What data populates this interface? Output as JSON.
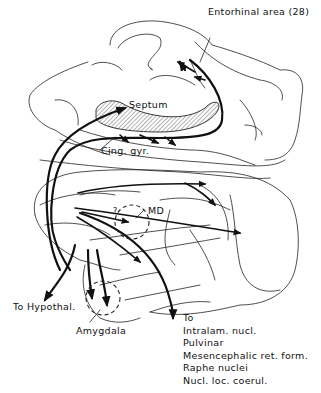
{
  "diagram": {
    "type": "anatomical pathway diagram (brain, lateral/medial view)",
    "labels": {
      "entorhinal": "Entorhinal area (28)",
      "septum": "Septum",
      "cingulate": "Cing. gyr.",
      "md": "MD",
      "question": "?",
      "hypothal": "To Hypothal.",
      "amygdala": "Amygdala",
      "to": "To"
    },
    "targets": [
      "Intralam. nucl.",
      "Pulvinar",
      "Mesencephalic ret. form.",
      "Raphe nuclei",
      "Nucl. loc. coerul."
    ],
    "colors": {
      "line": "#111111",
      "hatch": "#555555",
      "background": "#ffffff"
    }
  }
}
